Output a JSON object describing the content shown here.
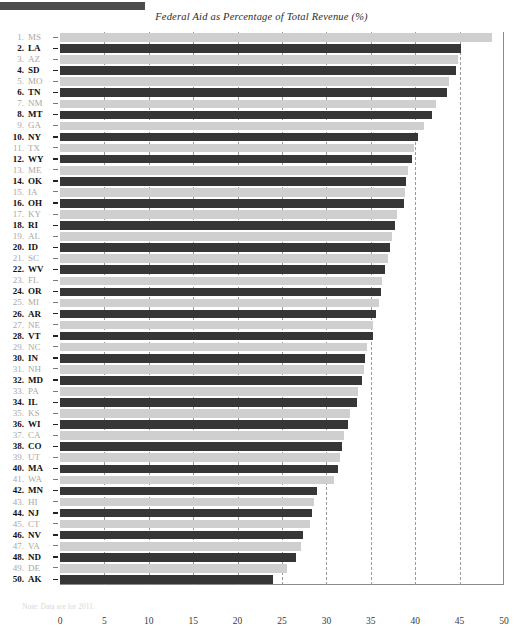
{
  "header": {
    "decorative_bar": "top-rule"
  },
  "chart_title": "Federal Aid as Percentage of Total Revenue (%)",
  "footnote": "Note: Data are for 2011.",
  "axis": {
    "ticks": [
      "0",
      "5",
      "10",
      "15",
      "20",
      "25",
      "30",
      "35",
      "40",
      "45",
      "50"
    ]
  },
  "chart_data": {
    "type": "bar",
    "orientation": "horizontal",
    "title": "Federal Aid as Percentage of Total Revenue (%)",
    "xlabel": "Federal Aid as Percentage of Total Revenue (%)",
    "ylabel": "",
    "xlim": [
      0,
      50
    ],
    "xticks": [
      0,
      5,
      10,
      15,
      20,
      25,
      30,
      35,
      40,
      45,
      50
    ],
    "grid": "vertical-dashed",
    "legend": "none",
    "colors": {
      "odd_rank": "#cfcfcf",
      "even_rank": "#363636"
    },
    "categories": [
      "MS",
      "LA",
      "AZ",
      "SD",
      "MO",
      "TN",
      "NM",
      "MT",
      "GA",
      "NY",
      "TX",
      "WY",
      "ME",
      "OK",
      "IA",
      "OH",
      "KY",
      "RI",
      "AL",
      "ID",
      "SC",
      "WV",
      "FL",
      "OR",
      "MI",
      "AR",
      "NE",
      "VT",
      "NC",
      "IN",
      "NH",
      "MD",
      "PA",
      "IL",
      "KS",
      "WI",
      "CA",
      "CO",
      "UT",
      "MA",
      "WA",
      "MN",
      "HI",
      "NJ",
      "CT",
      "NV",
      "VA",
      "ND",
      "DE",
      "AK"
    ],
    "ranks": [
      1,
      2,
      3,
      4,
      5,
      6,
      7,
      8,
      9,
      10,
      11,
      12,
      13,
      14,
      15,
      16,
      17,
      18,
      19,
      20,
      21,
      22,
      23,
      24,
      25,
      26,
      27,
      28,
      29,
      30,
      31,
      32,
      33,
      34,
      35,
      36,
      37,
      38,
      39,
      40,
      41,
      42,
      43,
      44,
      45,
      46,
      47,
      48,
      49,
      50
    ],
    "values": [
      48.6,
      45.2,
      44.8,
      44.6,
      43.8,
      43.6,
      42.3,
      41.9,
      41.0,
      40.3,
      39.9,
      39.6,
      39.2,
      39.0,
      38.9,
      38.7,
      37.9,
      37.7,
      37.4,
      37.2,
      36.9,
      36.6,
      36.3,
      36.1,
      35.9,
      35.6,
      35.3,
      35.2,
      34.6,
      34.4,
      34.2,
      34.0,
      33.6,
      33.4,
      32.7,
      32.4,
      32.0,
      31.8,
      31.5,
      31.3,
      30.9,
      28.9,
      28.6,
      28.4,
      28.1,
      27.4,
      27.1,
      26.6,
      25.6,
      24.0
    ]
  }
}
